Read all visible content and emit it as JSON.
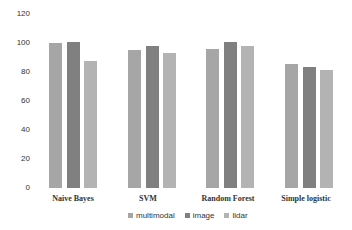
{
  "chart_data": {
    "type": "bar",
    "title": "",
    "xlabel": "",
    "ylabel": "",
    "ylim": [
      0,
      120
    ],
    "yticks": [
      0,
      20,
      40,
      60,
      80,
      100,
      120
    ],
    "grid": false,
    "legend_position": "bottom",
    "categories": [
      "Naive Bayes",
      "SVM",
      "Random Forest",
      "Simple logistic"
    ],
    "series": [
      {
        "name": "multimodal",
        "color": "#a6a6a6",
        "values": [
          99.5,
          94.5,
          95,
          85
        ]
      },
      {
        "name": "image",
        "color": "#808080",
        "values": [
          100,
          97,
          100,
          83
        ]
      },
      {
        "name": "lidar",
        "color": "#b3b3b3",
        "values": [
          87,
          92.5,
          97.5,
          80.5
        ]
      }
    ]
  },
  "labels": {
    "yticks": [
      "0",
      "20",
      "40",
      "60",
      "80",
      "100",
      "120"
    ],
    "categories": [
      "Naive Bayes",
      "SVM",
      "Random Forest",
      "Simple logistic"
    ],
    "legend": [
      "multimodal",
      "image",
      "lidar"
    ]
  }
}
